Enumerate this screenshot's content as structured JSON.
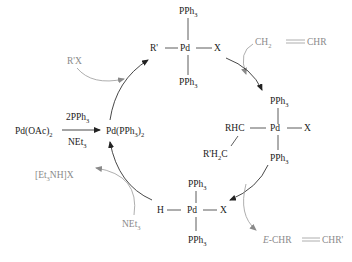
{
  "diagram": {
    "colors": {
      "main": "#1a1a1a",
      "reagent": "#8a8a8a"
    },
    "precatalyst": {
      "label": "Pd(OAc)",
      "sub": "2",
      "reagent_above": "2PPh",
      "reagent_above_sub": "3",
      "reagent_below": "NEt",
      "reagent_below_sub": "3"
    },
    "active_catalyst": {
      "label": "Pd(PPh",
      "sub": "3",
      "tail": ")",
      "tail_sub": "2"
    },
    "complexes": {
      "oxidative_addition": {
        "left": "R'",
        "center": "Pd",
        "right": "X",
        "top": "PPh",
        "top_sub": "3",
        "bottom": "PPh",
        "bottom_sub": "3"
      },
      "insertion": {
        "left": "RHC",
        "center": "Pd",
        "right": "X",
        "top": "PPh",
        "top_sub": "3",
        "bottom": "PPh",
        "bottom_sub": "3",
        "branch": "R'H",
        "branch_sub": "2",
        "branch_tail": "C"
      },
      "hydride": {
        "left": "H",
        "center": "Pd",
        "right": "X",
        "top": "PPh",
        "top_sub": "3",
        "bottom": "PPh",
        "bottom_sub": "3"
      }
    },
    "side_species": {
      "aryl_halide": "R'X",
      "alkene": {
        "left": "CH",
        "left_sub": "2",
        "right": "CHR"
      },
      "product": {
        "prefix": "E",
        "left": "-CHR",
        "right": "CHR'"
      },
      "base": {
        "label": "NEt",
        "sub": "3"
      },
      "salt": {
        "pre": "[Et",
        "sub": "3",
        "post": "NH]X"
      }
    }
  }
}
